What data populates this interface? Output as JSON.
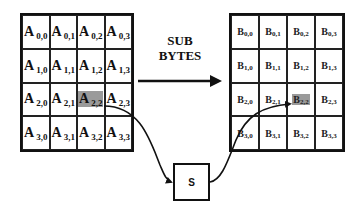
{
  "title": {
    "line1": "SUB",
    "line2": "BYTES"
  },
  "state_matrix": {
    "name": "A",
    "rows": [
      [
        {
          "main": "A",
          "sub": "0,0"
        },
        {
          "main": "A",
          "sub": "0,1"
        },
        {
          "main": "A",
          "sub": "0,2"
        },
        {
          "main": "A",
          "sub": "0,3"
        }
      ],
      [
        {
          "main": "A",
          "sub": "1,0"
        },
        {
          "main": "A",
          "sub": "1,1"
        },
        {
          "main": "A",
          "sub": "1,2"
        },
        {
          "main": "A",
          "sub": "1,3"
        }
      ],
      [
        {
          "main": "A",
          "sub": "2,0"
        },
        {
          "main": "A",
          "sub": "2,1"
        },
        {
          "main": "A",
          "sub": "2,2"
        },
        {
          "main": "A",
          "sub": "2,3"
        }
      ],
      [
        {
          "main": "A",
          "sub": "3,0"
        },
        {
          "main": "A",
          "sub": "3,1"
        },
        {
          "main": "A",
          "sub": "3,2"
        },
        {
          "main": "A",
          "sub": "3,3"
        }
      ]
    ],
    "highlighted_cell": "2,2"
  },
  "output_matrix": {
    "name": "B",
    "rows": [
      [
        {
          "main": "B",
          "sub": "0,0"
        },
        {
          "main": "B",
          "sub": "0,1"
        },
        {
          "main": "B",
          "sub": "0,2"
        },
        {
          "main": "B",
          "sub": "0,3"
        }
      ],
      [
        {
          "main": "B",
          "sub": "1,0"
        },
        {
          "main": "B",
          "sub": "1,1"
        },
        {
          "main": "B",
          "sub": "1,2"
        },
        {
          "main": "B",
          "sub": "1,3"
        }
      ],
      [
        {
          "main": "B",
          "sub": "2,0"
        },
        {
          "main": "B",
          "sub": "2,1"
        },
        {
          "main": "B",
          "sub": "2,2"
        },
        {
          "main": "B",
          "sub": "2,3"
        }
      ],
      [
        {
          "main": "B",
          "sub": "3,0"
        },
        {
          "main": "B",
          "sub": "3,1"
        },
        {
          "main": "B",
          "sub": "3,2"
        },
        {
          "main": "B",
          "sub": "3,3"
        }
      ]
    ],
    "highlighted_cell": "2,2"
  },
  "sbox": {
    "label": "S"
  },
  "colors": {
    "highlight": "#9a9a9a",
    "line": "#111111",
    "background": "#ffffff"
  }
}
